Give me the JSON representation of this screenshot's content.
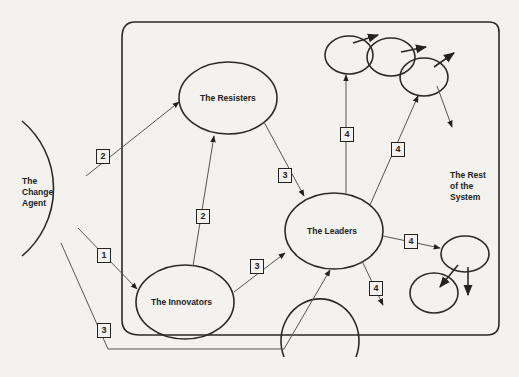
{
  "diagram": {
    "nodes": {
      "change_agent": "The Change Agent",
      "change_agent_lines": [
        "The",
        "Change",
        "Agent"
      ],
      "resisters": "The Resisters",
      "innovators": "The Innovators",
      "leaders": "The Leaders",
      "rest_of_system_lines": [
        "The Rest",
        "of the",
        "System"
      ]
    },
    "edges": [
      {
        "from": "The Change Agent",
        "to": "The Innovators",
        "step": "1"
      },
      {
        "from": "The Change Agent",
        "to": "The Resisters",
        "step": "2"
      },
      {
        "from": "The Innovators",
        "to": "The Resisters",
        "step": "2"
      },
      {
        "from": "The Change Agent",
        "to": "The Leaders",
        "step": "3"
      },
      {
        "from": "The Innovators",
        "to": "The Leaders",
        "step": "3"
      },
      {
        "from": "The Resisters",
        "to": "The Leaders",
        "step": "3"
      },
      {
        "from": "The Leaders",
        "to": "Rest of System (top)",
        "step": "4"
      },
      {
        "from": "The Leaders",
        "to": "Rest of System (top-right)",
        "step": "4"
      },
      {
        "from": "The Leaders",
        "to": "Rest of System (right)",
        "step": "4"
      },
      {
        "from": "The Leaders",
        "to": "Rest of System (bottom)",
        "step": "4"
      }
    ],
    "step_labels": {
      "s1": "1",
      "s2a": "2",
      "s2b": "2",
      "s3a": "3",
      "s3b": "3",
      "s3c": "3",
      "s4a": "4",
      "s4b": "4",
      "s4c": "4",
      "s4d": "4"
    }
  }
}
